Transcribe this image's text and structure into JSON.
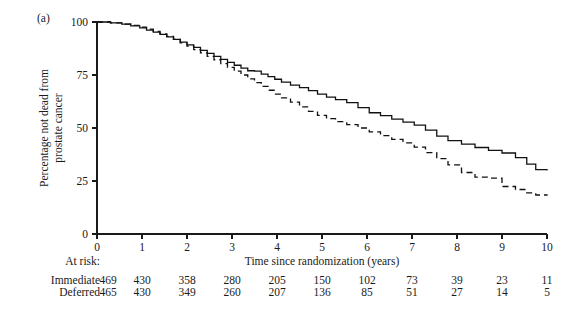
{
  "figure": {
    "panel_label": "(a)",
    "at_risk_header": "At risk:"
  },
  "chart_data": {
    "type": "line",
    "title": "",
    "subtitle": "",
    "xlabel": "Time since randomization (years)",
    "ylabel": "Percentage not dead from prostate cancer",
    "xlim": [
      0,
      10
    ],
    "ylim": [
      0,
      100
    ],
    "xticks": [
      0,
      1,
      2,
      3,
      4,
      5,
      6,
      7,
      8,
      9,
      10
    ],
    "xtick_labels": [
      "0",
      "1",
      "2",
      "3",
      "4",
      "5",
      "6",
      "7",
      "8",
      "9",
      "10"
    ],
    "yticks": [
      0,
      25,
      50,
      75,
      100
    ],
    "ytick_labels": [
      "0",
      "25",
      "50",
      "75",
      "100"
    ],
    "grid": false,
    "legend_position": "none",
    "annotations": [
      "(a)"
    ],
    "series": [
      {
        "name": "Immediate",
        "style": "solid",
        "color": "#111111",
        "x": [
          0.0,
          0.3,
          0.55,
          0.75,
          0.95,
          1.1,
          1.25,
          1.4,
          1.55,
          1.7,
          1.85,
          2.0,
          2.15,
          2.3,
          2.45,
          2.6,
          2.75,
          2.9,
          3.05,
          3.2,
          3.35,
          3.5,
          3.65,
          3.8,
          3.95,
          4.1,
          4.3,
          4.5,
          4.7,
          4.9,
          5.1,
          5.3,
          5.55,
          5.8,
          6.05,
          6.3,
          6.55,
          6.8,
          7.05,
          7.3,
          7.55,
          7.8,
          8.1,
          8.4,
          8.7,
          9.0,
          9.3,
          9.55,
          9.75,
          10.0
        ],
        "y": [
          100.0,
          99.6,
          99.0,
          98.2,
          97.2,
          96.2,
          95.2,
          94.2,
          93.0,
          91.8,
          90.5,
          89.2,
          88.0,
          86.6,
          85.2,
          83.8,
          82.4,
          81.0,
          79.6,
          78.2,
          77.0,
          76.8,
          75.4,
          74.2,
          73.0,
          71.6,
          70.2,
          69.0,
          67.6,
          66.0,
          64.6,
          63.4,
          62.0,
          59.6,
          57.2,
          55.8,
          54.2,
          52.8,
          51.4,
          49.0,
          46.2,
          44.0,
          42.4,
          40.8,
          39.4,
          38.2,
          36.0,
          33.0,
          30.4,
          30.0
        ],
        "final_value": 30.0
      },
      {
        "name": "Deferred",
        "style": "dashed",
        "color": "#111111",
        "x": [
          0.0,
          0.3,
          0.55,
          0.75,
          0.95,
          1.1,
          1.25,
          1.4,
          1.55,
          1.7,
          1.85,
          2.0,
          2.15,
          2.3,
          2.45,
          2.6,
          2.75,
          2.9,
          3.05,
          3.2,
          3.35,
          3.5,
          3.65,
          3.8,
          3.95,
          4.1,
          4.3,
          4.5,
          4.7,
          4.9,
          5.1,
          5.3,
          5.55,
          5.8,
          6.05,
          6.3,
          6.55,
          6.8,
          7.05,
          7.3,
          7.55,
          7.8,
          8.1,
          8.4,
          8.7,
          9.0,
          9.3,
          9.55,
          9.75,
          10.0
        ],
        "y": [
          100.0,
          99.6,
          99.0,
          98.4,
          97.6,
          96.6,
          95.6,
          94.4,
          93.2,
          91.8,
          90.2,
          88.6,
          87.0,
          85.4,
          83.8,
          82.2,
          80.4,
          78.6,
          76.8,
          75.0,
          73.2,
          71.4,
          69.6,
          67.8,
          66.0,
          64.2,
          62.2,
          60.0,
          57.8,
          56.0,
          54.4,
          53.0,
          51.6,
          50.0,
          48.2,
          46.4,
          44.6,
          43.0,
          41.0,
          38.4,
          35.6,
          32.6,
          29.0,
          26.8,
          26.4,
          22.4,
          21.0,
          19.4,
          18.4,
          18.0
        ],
        "final_value": 18.0
      }
    ]
  },
  "at_risk_table": {
    "times": [
      "0",
      "1",
      "2",
      "3",
      "4",
      "5",
      "6",
      "7",
      "8",
      "9",
      "10"
    ],
    "rows": [
      {
        "label": "Immediate",
        "counts": [
          "469",
          "430",
          "358",
          "280",
          "205",
          "150",
          "102",
          "73",
          "39",
          "23",
          "11"
        ]
      },
      {
        "label": "Deferred",
        "counts": [
          "465",
          "430",
          "349",
          "260",
          "207",
          "136",
          "85",
          "51",
          "27",
          "14",
          "5"
        ]
      }
    ]
  }
}
